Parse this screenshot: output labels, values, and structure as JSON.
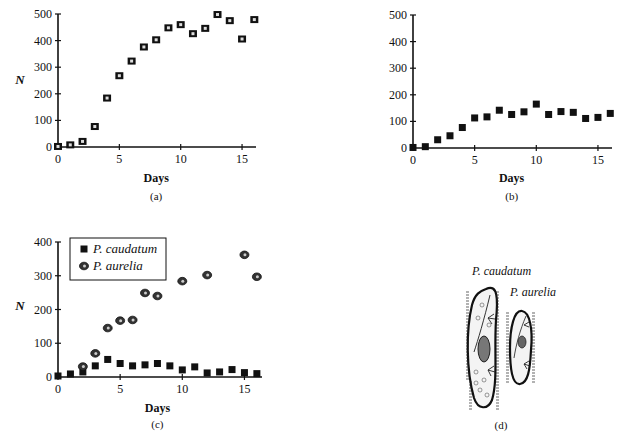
{
  "chart_data": [
    {
      "id": "a",
      "type": "scatter",
      "caption": "(a)",
      "xlabel": "Days",
      "ylabel": "N",
      "xlim": [
        0,
        16
      ],
      "ylim": [
        0,
        500
      ],
      "xticks": [
        0,
        5,
        10,
        15
      ],
      "yticks": [
        0,
        100,
        200,
        300,
        400,
        500
      ],
      "grid": false,
      "series": [
        {
          "name": "P. aurelia (alone)",
          "marker": "hollow-square",
          "x": [
            0,
            1,
            2,
            3,
            4,
            5,
            6,
            7,
            8,
            9,
            10,
            11,
            12,
            13,
            14,
            15,
            16
          ],
          "values": [
            2,
            8,
            21,
            77,
            184,
            268,
            323,
            376,
            403,
            448,
            460,
            426,
            446,
            498,
            475,
            406,
            479
          ]
        }
      ]
    },
    {
      "id": "b",
      "type": "scatter",
      "caption": "(b)",
      "xlabel": "Days",
      "ylabel": "",
      "xlim": [
        0,
        16
      ],
      "ylim": [
        0,
        500
      ],
      "xticks": [
        0,
        5,
        10,
        15
      ],
      "yticks": [
        0,
        100,
        200,
        300,
        400,
        500
      ],
      "grid": false,
      "series": [
        {
          "name": "P. caudatum (alone)",
          "marker": "filled-square",
          "x": [
            0,
            1,
            2,
            3,
            4,
            5,
            6,
            7,
            8,
            9,
            10,
            11,
            12,
            13,
            14,
            15,
            16
          ],
          "values": [
            2,
            5,
            31,
            46,
            77,
            113,
            117,
            142,
            126,
            136,
            165,
            126,
            137,
            134,
            111,
            115,
            130
          ]
        }
      ]
    },
    {
      "id": "c",
      "type": "scatter",
      "caption": "(c)",
      "xlabel": "Days",
      "ylabel": "N",
      "xlim": [
        0,
        16
      ],
      "ylim": [
        0,
        400
      ],
      "xticks": [
        0,
        5,
        10,
        15
      ],
      "yticks": [
        0,
        100,
        200,
        300,
        400
      ],
      "grid": false,
      "legend": {
        "position": "upper-left",
        "entries": [
          "P. caudatum",
          "P. aurelia"
        ]
      },
      "series": [
        {
          "name": "P. caudatum",
          "marker": "filled-square",
          "x": [
            0,
            1,
            2,
            3,
            4,
            5,
            6,
            7,
            8,
            9,
            10,
            11,
            12,
            13,
            14,
            15,
            16
          ],
          "values": [
            3,
            9,
            15,
            33,
            52,
            40,
            33,
            36,
            40,
            33,
            21,
            30,
            12,
            15,
            22,
            13,
            10
          ]
        },
        {
          "name": "P. aurelia",
          "marker": "dotted-circle",
          "x": [
            2,
            3,
            4,
            5,
            6,
            7,
            8,
            10,
            12,
            15,
            16
          ],
          "values": [
            31,
            70,
            145,
            167,
            169,
            249,
            240,
            284,
            302,
            362,
            297
          ]
        }
      ]
    }
  ],
  "panel_d": {
    "caption": "(d)",
    "labels": [
      "P. caudatum",
      "P. aurelia"
    ]
  }
}
